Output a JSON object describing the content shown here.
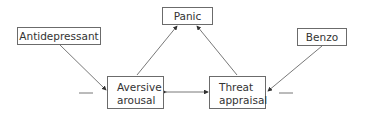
{
  "diagram": {
    "nodes": {
      "panic": {
        "label": "Panic"
      },
      "antidepressant": {
        "label": "Antidepressant"
      },
      "benzo": {
        "label": "Benzo"
      },
      "aversive": {
        "line1": "Aversive",
        "line2": "arousal"
      },
      "threat": {
        "line1": "Threat",
        "line2": "appraisal"
      }
    },
    "edges": [
      {
        "from": "antidepressant",
        "to": "aversive",
        "sign": "—"
      },
      {
        "from": "benzo",
        "to": "threat",
        "sign": "—"
      },
      {
        "from": "aversive",
        "to": "panic"
      },
      {
        "from": "threat",
        "to": "panic"
      },
      {
        "from": "aversive",
        "to": "threat",
        "bidirectional": true
      }
    ],
    "colors": {
      "line": "#555555",
      "border": "#6b6b6b",
      "text": "#333333"
    }
  }
}
